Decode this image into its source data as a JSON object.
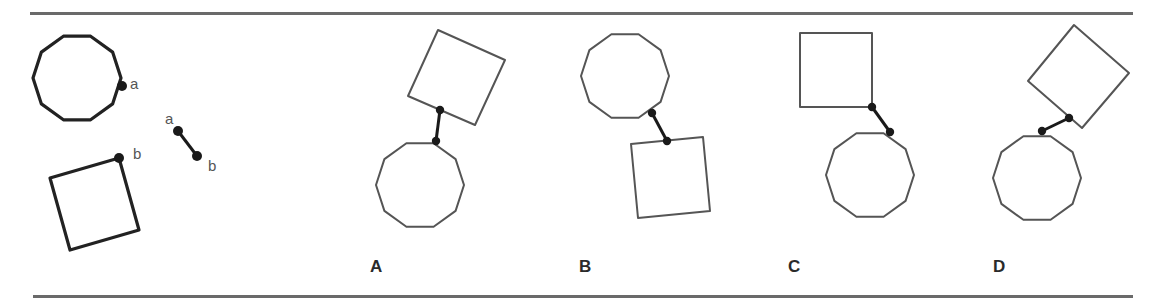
{
  "figure": {
    "rules": {
      "top": {
        "x1": 30,
        "x2": 1133,
        "y": 12
      },
      "bottom": {
        "x1": 33,
        "x2": 1133,
        "y": 295
      }
    },
    "colors": {
      "stroke_legend": "#222222",
      "stroke_option": "#555555",
      "dot": "#1a1a1a",
      "rule": "#6a6a6a"
    },
    "legend": {
      "polygon": {
        "cx": 77,
        "cy": 78,
        "r": 44,
        "sides": 10,
        "rotation_deg": 0
      },
      "polygon_dot": {
        "x": 122,
        "y": 86
      },
      "polygon_dot_label": {
        "text": "a",
        "x": 130,
        "y": 76
      },
      "square": {
        "points": [
          [
            119,
            158
          ],
          [
            50,
            178
          ],
          [
            70,
            250
          ],
          [
            139,
            230
          ]
        ]
      },
      "square_dot": {
        "x": 119,
        "y": 158
      },
      "square_dot_label": {
        "text": "b",
        "x": 133,
        "y": 146
      },
      "link_start": {
        "x": 178,
        "y": 131
      },
      "link_end": {
        "x": 197,
        "y": 156
      },
      "link_start_label": {
        "text": "a",
        "x": 165,
        "y": 111
      },
      "link_end_label": {
        "text": "b",
        "x": 208,
        "y": 158
      }
    },
    "options": [
      {
        "label": "A",
        "label_pos": {
          "x": 370,
          "y": 258
        },
        "polygon": {
          "cx": 420,
          "cy": 185,
          "r": 44,
          "sides": 10,
          "rotation_deg": 0
        },
        "square": {
          "points": [
            [
              438,
              30
            ],
            [
              505,
              60
            ],
            [
              475,
              125
            ],
            [
              408,
              96
            ]
          ]
        },
        "dot_square": {
          "x": 440,
          "y": 110
        },
        "dot_polygon": {
          "x": 436,
          "y": 141
        }
      },
      {
        "label": "B",
        "label_pos": {
          "x": 579,
          "y": 258
        },
        "polygon": {
          "cx": 625,
          "cy": 76,
          "r": 44,
          "sides": 10,
          "rotation_deg": 0
        },
        "square": {
          "points": [
            [
              631,
              144
            ],
            [
              703,
              137
            ],
            [
              710,
              211
            ],
            [
              638,
              218
            ]
          ]
        },
        "dot_square": {
          "x": 667,
          "y": 141
        },
        "dot_polygon": {
          "x": 652,
          "y": 113
        }
      },
      {
        "label": "C",
        "label_pos": {
          "x": 788,
          "y": 258
        },
        "polygon": {
          "cx": 870,
          "cy": 175,
          "r": 44,
          "sides": 10,
          "rotation_deg": 0
        },
        "square": {
          "points": [
            [
              800,
              33
            ],
            [
              872,
              33
            ],
            [
              872,
              107
            ],
            [
              800,
              107
            ]
          ]
        },
        "dot_square": {
          "x": 872,
          "y": 107
        },
        "dot_polygon": {
          "x": 890,
          "y": 132
        }
      },
      {
        "label": "D",
        "label_pos": {
          "x": 993,
          "y": 258
        },
        "polygon": {
          "cx": 1037,
          "cy": 178,
          "r": 44,
          "sides": 10,
          "rotation_deg": 0
        },
        "square": {
          "points": [
            [
              1074,
              25
            ],
            [
              1129,
              73
            ],
            [
              1082,
              128
            ],
            [
              1028,
              81
            ]
          ]
        },
        "dot_square": {
          "x": 1069,
          "y": 118
        },
        "dot_polygon": {
          "x": 1042,
          "y": 131
        }
      }
    ]
  }
}
